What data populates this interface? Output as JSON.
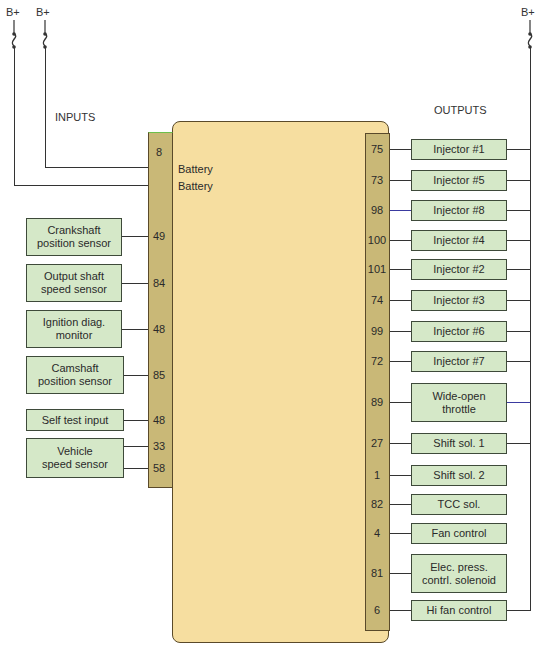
{
  "diagram": {
    "title_inputs": "INPUTS",
    "title_outputs": "OUTPUTS",
    "power_labels": [
      "B+",
      "B+",
      "B+"
    ],
    "ecm": {
      "battery_labels": [
        "Battery",
        "Battery"
      ],
      "battery_pin": "8"
    },
    "inputs": [
      {
        "label_line1": "Crankshaft",
        "label_line2": "position sensor",
        "pin": "49"
      },
      {
        "label_line1": "Output shaft",
        "label_line2": "speed sensor",
        "pin": "84"
      },
      {
        "label_line1": "Ignition diag.",
        "label_line2": "monitor",
        "pin": "48"
      },
      {
        "label_line1": "Camshaft",
        "label_line2": "position sensor",
        "pin": "85"
      },
      {
        "label_line1": "Self test input",
        "label_line2": "",
        "pin": "48"
      },
      {
        "label_line1": "Vehicle",
        "label_line2": "speed sensor",
        "pin": "33",
        "pin2": "58"
      }
    ],
    "outputs": [
      {
        "label_line1": "Injector #1",
        "label_line2": "",
        "pin": "75"
      },
      {
        "label_line1": "Injector #5",
        "label_line2": "",
        "pin": "73"
      },
      {
        "label_line1": "Injector #8",
        "label_line2": "",
        "pin": "98"
      },
      {
        "label_line1": "Injector #4",
        "label_line2": "",
        "pin": "100"
      },
      {
        "label_line1": "Injector #2",
        "label_line2": "",
        "pin": "101"
      },
      {
        "label_line1": "Injector #3",
        "label_line2": "",
        "pin": "74"
      },
      {
        "label_line1": "Injector #6",
        "label_line2": "",
        "pin": "99"
      },
      {
        "label_line1": "Injector #7",
        "label_line2": "",
        "pin": "72"
      },
      {
        "label_line1": "Wide-open",
        "label_line2": "throttle",
        "pin": "89"
      },
      {
        "label_line1": "Shift sol. 1",
        "label_line2": "",
        "pin": "27"
      },
      {
        "label_line1": "Shift sol. 2",
        "label_line2": "",
        "pin": "1"
      },
      {
        "label_line1": "TCC sol.",
        "label_line2": "",
        "pin": "82"
      },
      {
        "label_line1": "Fan control",
        "label_line2": "",
        "pin": "4"
      },
      {
        "label_line1": "Elec. press.",
        "label_line2": "contrl. solenoid",
        "pin": "81"
      },
      {
        "label_line1": "Hi fan control",
        "label_line2": "",
        "pin": "6"
      }
    ],
    "colors": {
      "ecm_fill": "#f6dea0",
      "connector_fill": "#c9b877",
      "box_fill": "#d5e8c8",
      "wire": "#333333"
    }
  }
}
